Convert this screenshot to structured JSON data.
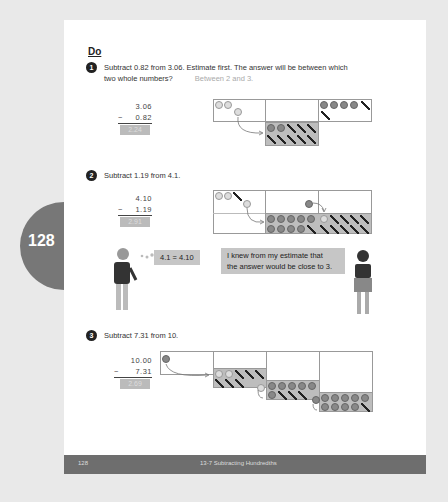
{
  "page_tab": {
    "number": "128"
  },
  "section_heading": "Do",
  "problems": [
    {
      "number": "1",
      "prompt_line1": "Subtract 0.82 from 3.06. Estimate first. The answer will be between which",
      "prompt_line2": "two whole numbers?",
      "estimate": "Between 2 and 3.",
      "top": "3.06",
      "minus_sign": "−",
      "bottom": "0.82",
      "answer": "2.24"
    },
    {
      "number": "2",
      "prompt_line1": "Subtract 1.19 from 4.1.",
      "top": "4.10",
      "minus_sign": "−",
      "bottom": "1.19",
      "answer": "2.91"
    },
    {
      "number": "3",
      "prompt_line1": "Subtract 7.31 from 10.",
      "top": "10.00",
      "minus_sign": "−",
      "bottom": "7.31",
      "answer": "2.69"
    }
  ],
  "dialogue": {
    "boy_thought": "4.1 = 4.10",
    "girl_line1": "I knew from my estimate that",
    "girl_line2": "the answer would be close to 3."
  },
  "coin_labels": {
    "one": "1",
    "tenth": "0.1",
    "hundredth": "0.01",
    "ten": "10"
  },
  "footer": {
    "page_number": "128",
    "lesson_title": "13-7 Subtracting Hundredths"
  },
  "colors": {
    "page_bg": "#ffffff",
    "outer_bg": "#e9e9e9",
    "footer_bar": "#6e6e6e",
    "tab_circle": "#777777",
    "answer_box": "#bbbbbb"
  }
}
